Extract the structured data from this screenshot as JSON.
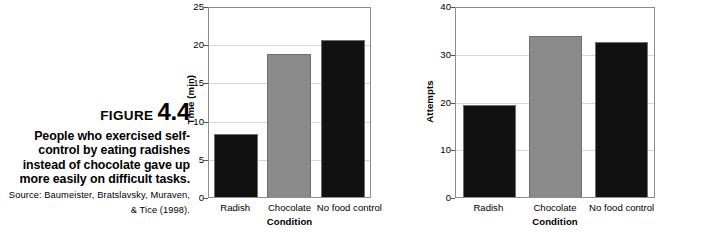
{
  "figure": {
    "heading_word": "FIGURE",
    "heading_number": "4.4",
    "caption": "People who exercised self-control by eating radishes instead of chocolate gave up more easily on difficult tasks.",
    "source": "Source: Baumeister, Bratslavsky, Muraven, & Tice (1998).",
    "credit": "© Cengage Learning"
  },
  "colors": {
    "bar_dark": "#111111",
    "bar_gray": "#8a8a8a",
    "bar_outline": "#6f6f6f",
    "gridline": "#d6d6d6",
    "axis": "#8c8c8c"
  },
  "chart_data": [
    {
      "type": "bar",
      "title": "",
      "xlabel": "Condition",
      "ylabel": "Time (min)",
      "categories": [
        "Radish",
        "Chocolate",
        "No food control"
      ],
      "values": [
        8.3,
        18.7,
        20.6
      ],
      "colors": [
        "#111111",
        "#8a8a8a",
        "#111111"
      ],
      "ylim": [
        0,
        25
      ],
      "yticks": [
        0,
        5,
        10,
        15,
        20,
        25
      ],
      "grid": true,
      "legend": "none"
    },
    {
      "type": "bar",
      "title": "",
      "xlabel": "Condition",
      "ylabel": "Attempts",
      "categories": [
        "Radish",
        "Chocolate",
        "No food control"
      ],
      "values": [
        19.3,
        33.8,
        32.4
      ],
      "colors": [
        "#111111",
        "#8a8a8a",
        "#111111"
      ],
      "ylim": [
        0,
        40
      ],
      "yticks": [
        0,
        10,
        20,
        30,
        40
      ],
      "grid": true,
      "legend": "none"
    }
  ]
}
